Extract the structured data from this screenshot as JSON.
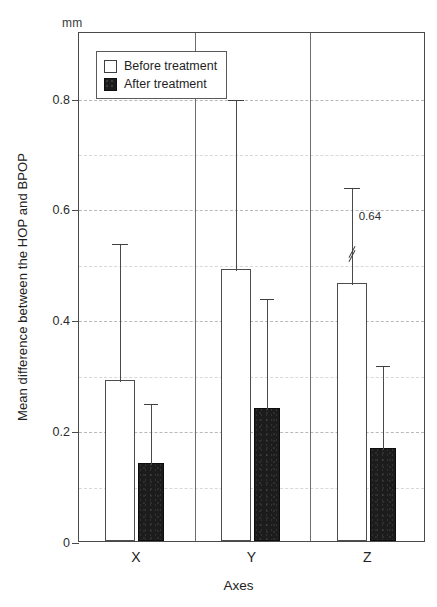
{
  "chart_data": {
    "type": "bar",
    "title": "",
    "unit_label": "mm",
    "categories": [
      "X",
      "Y",
      "Z"
    ],
    "xlabel": "Axes",
    "ylabel": "Mean difference between the HOP and BPOP",
    "ylim": [
      0,
      0.92
    ],
    "yticks": [
      0,
      0.2,
      0.4,
      0.6,
      0.8
    ],
    "ytick_labels": [
      "0",
      "0.2",
      "0.4",
      "0.6",
      "0.8"
    ],
    "minor_yticks": [
      0.1,
      0.3,
      0.5,
      0.7
    ],
    "grid": true,
    "legend_position": "upper-left-inside",
    "series": [
      {
        "name": "Before treatment",
        "color": "#ffffff",
        "edge_color": "#4d4d4d",
        "values": [
          0.29,
          0.49,
          0.465
        ],
        "error_upper": [
          0.54,
          0.8,
          0.64
        ],
        "broken_axis": [
          false,
          false,
          true
        ],
        "annotations": [
          "",
          "",
          "0.64"
        ]
      },
      {
        "name": "After treatment",
        "color": "#1c1c1c",
        "edge_color": "#0d0d0d",
        "values": [
          0.14,
          0.24,
          0.167
        ],
        "error_upper": [
          0.25,
          0.44,
          0.32
        ],
        "broken_axis": [
          false,
          false,
          false
        ],
        "annotations": [
          "",
          "",
          ""
        ]
      }
    ]
  },
  "legend": {
    "items": [
      {
        "label": "Before treatment",
        "swatch": "open-square"
      },
      {
        "label": "After treatment",
        "swatch": "filled-square"
      }
    ]
  }
}
